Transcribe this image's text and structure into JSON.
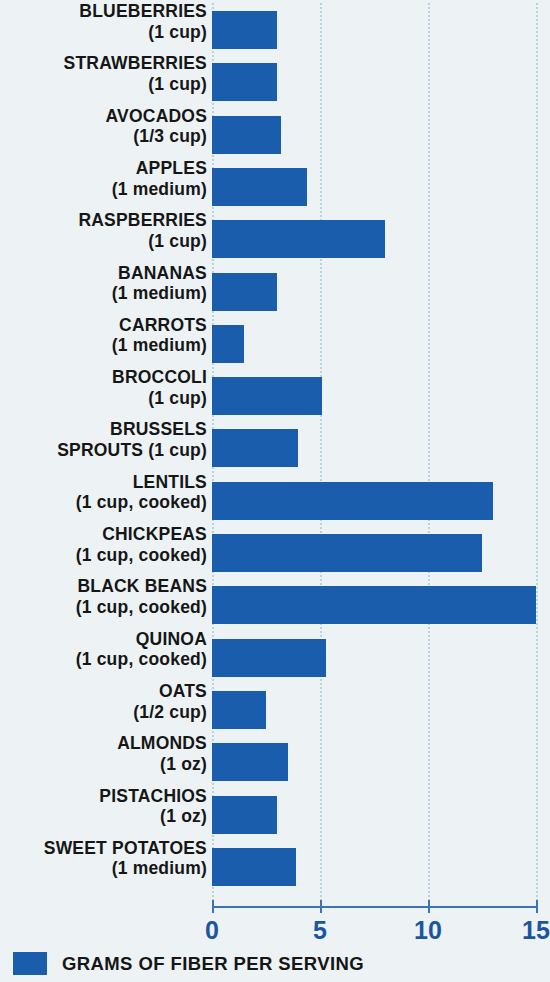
{
  "chart_data": {
    "type": "bar",
    "orientation": "horizontal",
    "title": "",
    "subtitle": "",
    "xlabel": "",
    "ylabel": "",
    "xlim": [
      0,
      15
    ],
    "xticks": [
      "0",
      "5",
      "10",
      "15"
    ],
    "xtick_values": [
      0,
      5,
      10,
      15
    ],
    "grid": true,
    "grid_axis": "x",
    "legend_position": "bottom-left",
    "legend": [
      "GRAMS OF FIBER PER SERVING"
    ],
    "bar_color": "#1b5dad",
    "background_color": "#edf3f5",
    "axis_color": "#3b72b8",
    "tick_label_color": "#1b55a0",
    "category_label_color": "#161616",
    "gridline_color": "#b9d2df",
    "categories": [
      "BLUEBERRIES (1 cup)",
      "STRAWBERRIES (1 cup)",
      "AVOCADOS (1/3 cup)",
      "APPLES (1 medium)",
      "RASPBERRIES (1 cup)",
      "BANANAS (1 medium)",
      "CARROTS (1 medium)",
      "BROCCOLI (1 cup)",
      "BRUSSELS SPROUTS (1 cup)",
      "LENTILS (1 cup, cooked)",
      "CHICKPEAS (1 cup, cooked)",
      "BLACK BEANS (1 cup, cooked)",
      "QUINOA (1 cup, cooked)",
      "OATS (1/2 cup)",
      "ALMONDS (1 oz)",
      "PISTACHIOS (1 oz)",
      "SWEET POTATOES (1 medium)"
    ],
    "values": [
      3,
      3,
      3.2,
      4.4,
      8,
      3,
      1.5,
      5.1,
      4,
      13,
      12.5,
      15,
      5.3,
      2.5,
      3.5,
      3,
      3.9
    ]
  },
  "rows": [
    {
      "name": "BLUEBERRIES",
      "serving": "(1 cup)",
      "value": 3,
      "layout": "stacked"
    },
    {
      "name": "STRAWBERRIES",
      "serving": "(1 cup)",
      "value": 3,
      "layout": "stacked"
    },
    {
      "name": "AVOCADOS",
      "serving": "(1/3 cup)",
      "value": 3.2,
      "layout": "stacked"
    },
    {
      "name": "APPLES",
      "serving": "(1 medium)",
      "value": 4.4,
      "layout": "stacked"
    },
    {
      "name": "RASPBERRIES",
      "serving": "(1 cup)",
      "value": 8,
      "layout": "stacked"
    },
    {
      "name": "BANANAS",
      "serving": "(1 medium)",
      "value": 3,
      "layout": "stacked"
    },
    {
      "name": "CARROTS",
      "serving": "(1 medium)",
      "value": 1.5,
      "layout": "stacked"
    },
    {
      "name": "BROCCOLI",
      "serving": "(1 cup)",
      "value": 5.1,
      "layout": "stacked"
    },
    {
      "name": "BRUSSELS",
      "serving": "SPROUTS (1 cup)",
      "value": 4,
      "layout": "stacked"
    },
    {
      "name": "LENTILS",
      "serving": "(1 cup, cooked)",
      "value": 13,
      "layout": "stacked"
    },
    {
      "name": "CHICKPEAS",
      "serving": "(1 cup, cooked)",
      "value": 12.5,
      "layout": "stacked"
    },
    {
      "name": "BLACK BEANS",
      "serving": "(1 cup, cooked)",
      "value": 15,
      "layout": "stacked"
    },
    {
      "name": "QUINOA",
      "serving": "(1 cup, cooked)",
      "value": 5.3,
      "layout": "stacked"
    },
    {
      "name": "OATS",
      "serving": "(1/2 cup)",
      "value": 2.5,
      "layout": "stacked"
    },
    {
      "name": "ALMONDS",
      "serving": "(1 oz)",
      "value": 3.5,
      "layout": "stacked"
    },
    {
      "name": "PISTACHIOS",
      "serving": "(1 oz)",
      "value": 3,
      "layout": "stacked"
    },
    {
      "name": "SWEET POTATOES",
      "serving": "(1 medium)",
      "value": 3.9,
      "layout": "stacked"
    }
  ],
  "axis": {
    "ticks": [
      {
        "label": "0",
        "value": 0
      },
      {
        "label": "5",
        "value": 5
      },
      {
        "label": "10",
        "value": 10
      },
      {
        "label": "15",
        "value": 15
      }
    ]
  },
  "legend": {
    "label": "GRAMS OF FIBER PER SERVING",
    "swatch_color": "#1b5dad"
  }
}
